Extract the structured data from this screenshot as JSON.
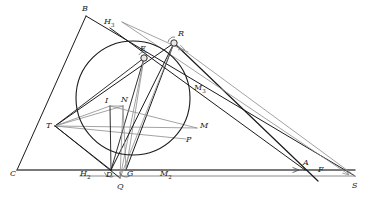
{
  "figure": {
    "type": "euclidean-geometry-diagram",
    "width": 377,
    "height": 199,
    "background_color": "#ffffff"
  },
  "colors": {
    "stroke_dark": "#1a1a1a",
    "stroke_medium": "#4d4d4d",
    "stroke_light": "#8c8c8c",
    "stroke_faint": "#a6a6a6",
    "label_color": "#1a1a1a",
    "marker_fill": "#e8e8e8"
  },
  "points": [
    {
      "id": "B",
      "label": "B",
      "sub": "",
      "x": 86,
      "y": 16,
      "label_x": 82,
      "label_y": 5,
      "marker": false
    },
    {
      "id": "H3",
      "label": "H",
      "sub": "3",
      "x": 110,
      "y": 28,
      "label_x": 104,
      "label_y": 18,
      "marker": false
    },
    {
      "id": "R",
      "label": "R",
      "sub": "",
      "x": 174,
      "y": 43,
      "label_x": 178,
      "label_y": 30,
      "marker": true
    },
    {
      "id": "E",
      "label": "E",
      "sub": "",
      "x": 144,
      "y": 58,
      "label_x": 140,
      "label_y": 45,
      "marker": true
    },
    {
      "id": "M3",
      "label": "M",
      "sub": "3",
      "x": 190,
      "y": 90,
      "label_x": 194,
      "label_y": 84,
      "marker": false
    },
    {
      "id": "I",
      "label": "I",
      "sub": "",
      "x": 110,
      "y": 106,
      "label_x": 105,
      "label_y": 97,
      "marker": false
    },
    {
      "id": "N",
      "label": "N",
      "sub": "",
      "x": 123,
      "y": 106,
      "label_x": 121,
      "label_y": 96,
      "marker": false
    },
    {
      "id": "T",
      "label": "T",
      "sub": "",
      "x": 55,
      "y": 126,
      "label_x": 46,
      "label_y": 122,
      "marker": false
    },
    {
      "id": "M",
      "label": "M",
      "sub": "",
      "x": 197,
      "y": 128,
      "label_x": 200,
      "label_y": 122,
      "marker": false
    },
    {
      "id": "P",
      "label": "P",
      "sub": "",
      "x": 186,
      "y": 139,
      "label_x": 186,
      "label_y": 136,
      "marker": false
    },
    {
      "id": "C",
      "label": "C",
      "sub": "",
      "x": 17,
      "y": 170,
      "label_x": 10,
      "label_y": 170,
      "marker": false
    },
    {
      "id": "H2",
      "label": "H",
      "sub": "2",
      "x": 96,
      "y": 176,
      "label_x": 80,
      "label_y": 170,
      "marker": false
    },
    {
      "id": "D",
      "label": "D",
      "sub": "",
      "x": 111,
      "y": 170,
      "label_x": 106,
      "label_y": 171,
      "marker": false
    },
    {
      "id": "G",
      "label": "G",
      "sub": "",
      "x": 126,
      "y": 170,
      "label_x": 127,
      "label_y": 170,
      "marker": false
    },
    {
      "id": "Q",
      "label": "Q",
      "sub": "",
      "x": 120,
      "y": 178,
      "label_x": 117,
      "label_y": 183,
      "marker": false
    },
    {
      "id": "M2",
      "label": "M",
      "sub": "2",
      "x": 163,
      "y": 176,
      "label_x": 160,
      "label_y": 170,
      "marker": false
    },
    {
      "id": "A",
      "label": "A",
      "sub": "",
      "x": 305,
      "y": 170,
      "label_x": 303,
      "label_y": 159,
      "marker": false
    },
    {
      "id": "F",
      "label": "F",
      "sub": "",
      "x": 318,
      "y": 176,
      "label_x": 318,
      "label_y": 166,
      "marker": false
    },
    {
      "id": "S",
      "label": "S",
      "sub": "",
      "x": 355,
      "y": 176,
      "label_x": 352,
      "label_y": 182,
      "marker": false
    }
  ],
  "circle": {
    "name": "main-circle",
    "cx": 133,
    "cy": 98,
    "r": 57,
    "stroke": "#1a1a1a",
    "stroke_width": 1.1
  },
  "segments": [
    {
      "name": "line-B-C",
      "x1": 86,
      "y1": 16,
      "x2": 17,
      "y2": 170,
      "stroke": "#1a1a1a",
      "width": 1.0
    },
    {
      "name": "line-B-R-S",
      "x1": 86,
      "y1": 16,
      "x2": 355,
      "y2": 176,
      "stroke": "#1a1a1a",
      "width": 1.0
    },
    {
      "name": "line-C-A-S",
      "x1": 17,
      "y1": 170,
      "x2": 355,
      "y2": 170,
      "stroke": "#4d4d4d",
      "width": 1.4
    },
    {
      "name": "line-H2-S-lower",
      "x1": 80,
      "y1": 176,
      "x2": 355,
      "y2": 176,
      "stroke": "#8c8c8c",
      "width": 1.2
    },
    {
      "name": "line-T-R",
      "x1": 55,
      "y1": 126,
      "x2": 174,
      "y2": 43,
      "stroke": "#1a1a1a",
      "width": 1.0
    },
    {
      "name": "line-T-E",
      "x1": 55,
      "y1": 126,
      "x2": 144,
      "y2": 58,
      "stroke": "#1a1a1a",
      "width": 0.9
    },
    {
      "name": "line-T-I",
      "x1": 55,
      "y1": 126,
      "x2": 110,
      "y2": 106,
      "stroke": "#8c8c8c",
      "width": 0.8
    },
    {
      "name": "line-T-N",
      "x1": 55,
      "y1": 126,
      "x2": 123,
      "y2": 106,
      "stroke": "#8c8c8c",
      "width": 0.8
    },
    {
      "name": "line-T-M",
      "x1": 55,
      "y1": 126,
      "x2": 197,
      "y2": 128,
      "stroke": "#8c8c8c",
      "width": 0.8
    },
    {
      "name": "line-T-P",
      "x1": 55,
      "y1": 126,
      "x2": 186,
      "y2": 139,
      "stroke": "#8c8c8c",
      "width": 0.8
    },
    {
      "name": "line-T-Q",
      "x1": 55,
      "y1": 126,
      "x2": 120,
      "y2": 178,
      "stroke": "#1a1a1a",
      "width": 1.0
    },
    {
      "name": "line-T-D",
      "x1": 55,
      "y1": 126,
      "x2": 111,
      "y2": 170,
      "stroke": "#1a1a1a",
      "width": 0.9
    },
    {
      "name": "line-E-D",
      "x1": 144,
      "y1": 58,
      "x2": 111,
      "y2": 170,
      "stroke": "#1a1a1a",
      "width": 0.9
    },
    {
      "name": "line-E-G",
      "x1": 144,
      "y1": 58,
      "x2": 126,
      "y2": 170,
      "stroke": "#8c8c8c",
      "width": 0.8
    },
    {
      "name": "line-E-Q",
      "x1": 144,
      "y1": 58,
      "x2": 120,
      "y2": 178,
      "stroke": "#8c8c8c",
      "width": 0.8
    },
    {
      "name": "line-R-D",
      "x1": 174,
      "y1": 43,
      "x2": 111,
      "y2": 170,
      "stroke": "#1a1a1a",
      "width": 1.0
    },
    {
      "name": "line-R-G",
      "x1": 174,
      "y1": 43,
      "x2": 126,
      "y2": 170,
      "stroke": "#1a1a1a",
      "width": 1.0
    },
    {
      "name": "line-R-Q",
      "x1": 174,
      "y1": 43,
      "x2": 120,
      "y2": 178,
      "stroke": "#8c8c8c",
      "width": 0.8
    },
    {
      "name": "line-R-A",
      "x1": 174,
      "y1": 43,
      "x2": 318,
      "y2": 181,
      "stroke": "#1a1a1a",
      "width": 1.2
    },
    {
      "name": "line-H3-M3-A",
      "x1": 110,
      "y1": 28,
      "x2": 305,
      "y2": 170,
      "stroke": "#1a1a1a",
      "width": 1.0
    },
    {
      "name": "line-I-D",
      "x1": 110,
      "y1": 106,
      "x2": 111,
      "y2": 170,
      "stroke": "#1a1a1a",
      "width": 0.9
    },
    {
      "name": "line-N-G",
      "x1": 123,
      "y1": 106,
      "x2": 126,
      "y2": 170,
      "stroke": "#8c8c8c",
      "width": 0.8
    },
    {
      "name": "line-I-N",
      "x1": 110,
      "y1": 106,
      "x2": 123,
      "y2": 106,
      "stroke": "#8c8c8c",
      "width": 0.8
    },
    {
      "name": "line-I-M",
      "x1": 110,
      "y1": 106,
      "x2": 197,
      "y2": 128,
      "stroke": "#8c8c8c",
      "width": 0.8
    },
    {
      "name": "line-N-Q",
      "x1": 123,
      "y1": 106,
      "x2": 120,
      "y2": 178,
      "stroke": "#8c8c8c",
      "width": 0.8
    },
    {
      "name": "line-E-upper-ray",
      "x1": 122,
      "y1": 22,
      "x2": 188,
      "y2": 52,
      "stroke": "#8c8c8c",
      "width": 0.8
    },
    {
      "name": "line-R-S-gray",
      "x1": 174,
      "y1": 43,
      "x2": 355,
      "y2": 176,
      "stroke": "#8c8c8c",
      "width": 0.8
    },
    {
      "name": "line-topray-S",
      "x1": 122,
      "y1": 22,
      "x2": 348,
      "y2": 174,
      "stroke": "#8c8c8c",
      "width": 0.8
    }
  ],
  "arrowheads": [
    {
      "name": "arrow-to-A",
      "x": 299,
      "y": 170,
      "angle": 0,
      "stroke": "#4d4d4d"
    },
    {
      "name": "arrow-to-S",
      "x": 349,
      "y": 175,
      "angle": 38,
      "stroke": "#8c8c8c"
    },
    {
      "name": "arrow-at-R",
      "x": 185,
      "y": 50,
      "angle": 25,
      "stroke": "#8c8c8c"
    }
  ],
  "angle_marks": [
    {
      "name": "angle-at-D",
      "cx": 111,
      "cy": 170,
      "r": 7,
      "start": 200,
      "end": 290
    },
    {
      "name": "angle-at-G",
      "cx": 126,
      "cy": 170,
      "r": 7,
      "start": 200,
      "end": 300
    },
    {
      "name": "angle-at-E",
      "cx": 144,
      "cy": 58,
      "r": 6,
      "start": 60,
      "end": 150
    },
    {
      "name": "angle-at-R",
      "cx": 174,
      "cy": 43,
      "r": 6,
      "start": 80,
      "end": 170
    }
  ]
}
